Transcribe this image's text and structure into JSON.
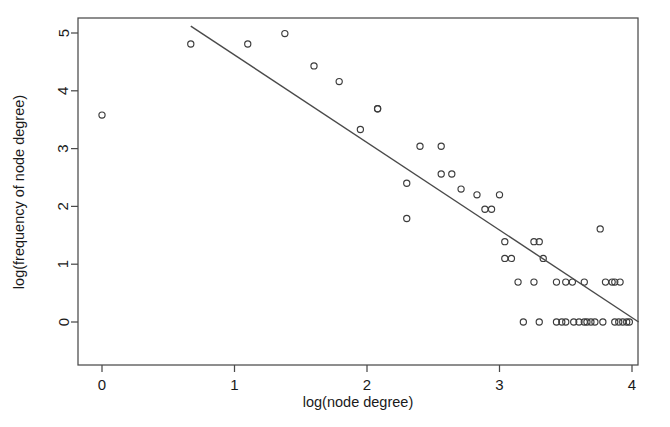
{
  "figure": {
    "background_color": "#ffffff",
    "frame_color": "#4a4a4a",
    "point_color": "#3c3c3c",
    "line_color": "#4a4a4a"
  },
  "chart_data": {
    "type": "scatter",
    "title": "",
    "subtitle": "",
    "xlabel": "log(node degree)",
    "ylabel": "log(frequency of node degree)",
    "xlim": [
      -0.18,
      4.05
    ],
    "ylim": [
      -0.1,
      5.12
    ],
    "xticks": [
      0,
      1,
      2,
      3,
      4
    ],
    "xtick_labels": [
      "0",
      "1",
      "2",
      "3",
      "4"
    ],
    "yticks": [
      0,
      1,
      2,
      3,
      4,
      5
    ],
    "ytick_labels": [
      "0",
      "1",
      "2",
      "3",
      "4",
      "5"
    ],
    "grid": false,
    "legend": null,
    "legend_position": "none",
    "marker": "open-circle",
    "marker_size": 3.1,
    "series": [
      {
        "name": "node degree distribution",
        "points": [
          [
            0.0,
            3.58
          ],
          [
            0.67,
            4.81
          ],
          [
            1.1,
            4.81
          ],
          [
            1.38,
            4.99
          ],
          [
            1.6,
            4.43
          ],
          [
            1.79,
            4.16
          ],
          [
            1.95,
            3.33
          ],
          [
            2.08,
            3.69
          ],
          [
            2.08,
            3.69
          ],
          [
            2.3,
            2.4
          ],
          [
            2.3,
            1.79
          ],
          [
            2.4,
            3.04
          ],
          [
            2.56,
            3.04
          ],
          [
            2.56,
            2.56
          ],
          [
            2.64,
            2.56
          ],
          [
            2.71,
            2.3
          ],
          [
            2.83,
            2.2
          ],
          [
            2.89,
            1.95
          ],
          [
            2.94,
            1.95
          ],
          [
            3.0,
            2.2
          ],
          [
            3.04,
            1.39
          ],
          [
            3.04,
            1.1
          ],
          [
            3.09,
            1.1
          ],
          [
            3.14,
            0.69
          ],
          [
            3.26,
            0.69
          ],
          [
            3.26,
            1.39
          ],
          [
            3.3,
            1.39
          ],
          [
            3.33,
            1.1
          ],
          [
            3.43,
            0.69
          ],
          [
            3.5,
            0.69
          ],
          [
            3.55,
            0.69
          ],
          [
            3.64,
            0.69
          ],
          [
            3.76,
            1.61
          ],
          [
            3.8,
            0.69
          ],
          [
            3.85,
            0.69
          ],
          [
            3.87,
            0.69
          ],
          [
            3.91,
            0.69
          ],
          [
            3.18,
            0.0
          ],
          [
            3.3,
            0.0
          ],
          [
            3.43,
            0.0
          ],
          [
            3.47,
            0.0
          ],
          [
            3.5,
            0.0
          ],
          [
            3.56,
            0.0
          ],
          [
            3.6,
            0.0
          ],
          [
            3.64,
            0.0
          ],
          [
            3.66,
            0.0
          ],
          [
            3.69,
            0.0
          ],
          [
            3.72,
            0.0
          ],
          [
            3.78,
            0.0
          ],
          [
            3.87,
            0.0
          ],
          [
            3.9,
            0.0
          ],
          [
            3.93,
            0.0
          ],
          [
            3.96,
            0.0
          ],
          [
            3.98,
            0.0
          ]
        ]
      }
    ],
    "fit_line": {
      "name": "linear fit",
      "x_start": 0.67,
      "y_start": 5.12,
      "x_end": 4.05,
      "y_end": 0.0,
      "slope": -1.515,
      "intercept": 6.135
    }
  }
}
